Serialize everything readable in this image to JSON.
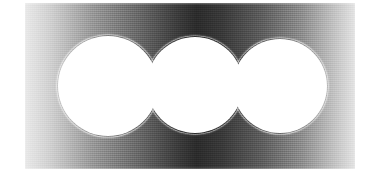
{
  "image": {
    "title": "Abstract grayscale figure",
    "description": "Three overlapping white circles on a horizontally graded gray rectangular plate",
    "canvas": {
      "width": 384,
      "height": 177,
      "background": "#ffffff"
    },
    "plate": {
      "x": 25,
      "y": 3,
      "width": 330,
      "height": 166,
      "base_color": "#808080",
      "gradient_type": "linear-horizontal",
      "gradient_angle_deg": 90,
      "gradient_stops": [
        {
          "offset_pct": 0,
          "color": "#e9e9e9"
        },
        {
          "offset_pct": 8,
          "color": "#cfcfcf"
        },
        {
          "offset_pct": 20,
          "color": "#9a9a9a"
        },
        {
          "offset_pct": 34,
          "color": "#6a6a6a"
        },
        {
          "offset_pct": 46,
          "color": "#3d3d3d"
        },
        {
          "offset_pct": 52,
          "color": "#2b2b2b"
        },
        {
          "offset_pct": 60,
          "color": "#3a3a3a"
        },
        {
          "offset_pct": 72,
          "color": "#5e5e5e"
        },
        {
          "offset_pct": 84,
          "color": "#8e8e8e"
        },
        {
          "offset_pct": 94,
          "color": "#c4c4c4"
        },
        {
          "offset_pct": 100,
          "color": "#e3e3e3"
        }
      ],
      "darkest_x_px": 195,
      "darkest_color": "#2b2b2b",
      "lightest_color": "#e9e9e9"
    },
    "shapes": [
      {
        "name": "circle-left",
        "cx": 108,
        "cy": 86,
        "r": 50,
        "fill": "#ffffff"
      },
      {
        "name": "circle-middle",
        "cx": 195,
        "cy": 85,
        "r": 48,
        "fill": "#ffffff"
      },
      {
        "name": "circle-right",
        "cx": 280,
        "cy": 86,
        "r": 47,
        "fill": "#ffffff"
      }
    ],
    "cusps": [
      {
        "name": "cusp-left",
        "x": 152,
        "y": 62
      },
      {
        "name": "cusp-right",
        "x": 237,
        "y": 62
      }
    ],
    "palette": {
      "white": "#ffffff",
      "light_gray": "#e9e9e9",
      "mid_gray": "#808080",
      "dark_gray": "#3d3d3d",
      "near_black": "#2b2b2b"
    }
  }
}
